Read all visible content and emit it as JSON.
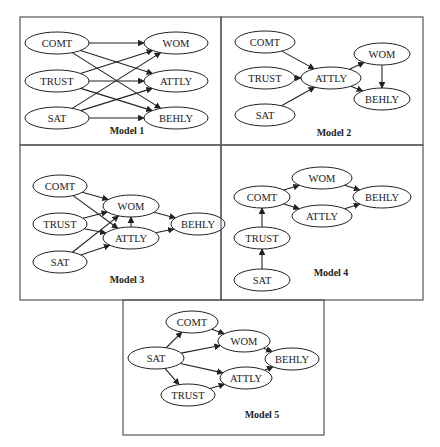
{
  "figure": {
    "panels": [
      {
        "id": "m1",
        "caption": "Model 1",
        "box": [
          20,
          17,
          201,
          128
        ],
        "caption_pos": [
          127,
          134
        ],
        "nodes": [
          {
            "id": "COMT",
            "label": "COMT",
            "cx": 57,
            "cy": 43,
            "rx": 32,
            "ry": 11
          },
          {
            "id": "TRUST",
            "label": "TRUST",
            "cx": 57,
            "cy": 81,
            "rx": 32,
            "ry": 11
          },
          {
            "id": "SAT",
            "label": "SAT",
            "cx": 57,
            "cy": 118,
            "rx": 32,
            "ry": 11
          },
          {
            "id": "WOM",
            "label": "WOM",
            "cx": 176,
            "cy": 43,
            "rx": 32,
            "ry": 11
          },
          {
            "id": "ATTLY",
            "label": "ATTLY",
            "cx": 176,
            "cy": 81,
            "rx": 32,
            "ry": 11
          },
          {
            "id": "BEHLY",
            "label": "BEHLY",
            "cx": 176,
            "cy": 118,
            "rx": 32,
            "ry": 11
          }
        ],
        "edges": [
          [
            "COMT",
            "WOM"
          ],
          [
            "COMT",
            "ATTLY"
          ],
          [
            "COMT",
            "BEHLY"
          ],
          [
            "TRUST",
            "WOM"
          ],
          [
            "TRUST",
            "ATTLY"
          ],
          [
            "TRUST",
            "BEHLY"
          ],
          [
            "SAT",
            "WOM"
          ],
          [
            "SAT",
            "ATTLY"
          ],
          [
            "SAT",
            "BEHLY"
          ]
        ]
      },
      {
        "id": "m2",
        "caption": "Model 2",
        "box": [
          221,
          17,
          202,
          128
        ],
        "caption_pos": [
          334,
          136
        ],
        "nodes": [
          {
            "id": "COMT",
            "label": "COMT",
            "cx": 265,
            "cy": 42,
            "rx": 30,
            "ry": 11
          },
          {
            "id": "TRUST",
            "label": "TRUST",
            "cx": 265,
            "cy": 78,
            "rx": 30,
            "ry": 11
          },
          {
            "id": "SAT",
            "label": "SAT",
            "cx": 265,
            "cy": 115,
            "rx": 30,
            "ry": 11
          },
          {
            "id": "ATTLY",
            "label": "ATTLY",
            "cx": 331,
            "cy": 78,
            "rx": 30,
            "ry": 11
          },
          {
            "id": "WOM",
            "label": "WOM",
            "cx": 382,
            "cy": 54,
            "rx": 28,
            "ry": 11
          },
          {
            "id": "BEHLY",
            "label": "BEHLY",
            "cx": 382,
            "cy": 99,
            "rx": 28,
            "ry": 11
          }
        ],
        "edges": [
          [
            "COMT",
            "ATTLY"
          ],
          [
            "TRUST",
            "ATTLY"
          ],
          [
            "SAT",
            "ATTLY"
          ],
          [
            "ATTLY",
            "WOM"
          ],
          [
            "ATTLY",
            "BEHLY"
          ],
          [
            "WOM",
            "BEHLY"
          ]
        ]
      },
      {
        "id": "m3",
        "caption": "Model 3",
        "box": [
          20,
          145,
          201,
          155
        ],
        "caption_pos": [
          127,
          283
        ],
        "nodes": [
          {
            "id": "COMT",
            "label": "COMT",
            "cx": 60,
            "cy": 186,
            "rx": 27,
            "ry": 11
          },
          {
            "id": "TRUST",
            "label": "TRUST",
            "cx": 60,
            "cy": 224,
            "rx": 27,
            "ry": 11
          },
          {
            "id": "SAT",
            "label": "SAT",
            "cx": 60,
            "cy": 262,
            "rx": 27,
            "ry": 11
          },
          {
            "id": "WOM",
            "label": "WOM",
            "cx": 131,
            "cy": 206,
            "rx": 28,
            "ry": 11
          },
          {
            "id": "ATTLY",
            "label": "ATTLY",
            "cx": 131,
            "cy": 238,
            "rx": 28,
            "ry": 11
          },
          {
            "id": "BEHLY",
            "label": "BEHLY",
            "cx": 198,
            "cy": 224,
            "rx": 27,
            "ry": 11
          }
        ],
        "edges": [
          [
            "COMT",
            "WOM"
          ],
          [
            "COMT",
            "ATTLY"
          ],
          [
            "TRUST",
            "WOM"
          ],
          [
            "TRUST",
            "ATTLY"
          ],
          [
            "SAT",
            "WOM"
          ],
          [
            "SAT",
            "ATTLY"
          ],
          [
            "ATTLY",
            "WOM"
          ],
          [
            "WOM",
            "BEHLY"
          ],
          [
            "ATTLY",
            "BEHLY"
          ]
        ]
      },
      {
        "id": "m4",
        "caption": "Model 4",
        "box": [
          221,
          145,
          202,
          155
        ],
        "caption_pos": [
          331,
          276
        ],
        "nodes": [
          {
            "id": "COMT",
            "label": "COMT",
            "cx": 262,
            "cy": 197,
            "rx": 28,
            "ry": 11
          },
          {
            "id": "TRUST",
            "label": "TRUST",
            "cx": 262,
            "cy": 238,
            "rx": 28,
            "ry": 11
          },
          {
            "id": "SAT",
            "label": "SAT",
            "cx": 262,
            "cy": 280,
            "rx": 28,
            "ry": 11
          },
          {
            "id": "WOM",
            "label": "WOM",
            "cx": 322,
            "cy": 178,
            "rx": 30,
            "ry": 11
          },
          {
            "id": "ATTLY",
            "label": "ATTLY",
            "cx": 322,
            "cy": 216,
            "rx": 30,
            "ry": 11
          },
          {
            "id": "BEHLY",
            "label": "BEHLY",
            "cx": 382,
            "cy": 197,
            "rx": 29,
            "ry": 11
          }
        ],
        "edges": [
          [
            "SAT",
            "TRUST"
          ],
          [
            "TRUST",
            "COMT"
          ],
          [
            "COMT",
            "WOM"
          ],
          [
            "COMT",
            "ATTLY"
          ],
          [
            "WOM",
            "BEHLY"
          ],
          [
            "ATTLY",
            "BEHLY"
          ]
        ]
      },
      {
        "id": "m5",
        "caption": "Model 5",
        "box": [
          123,
          300,
          201,
          135
        ],
        "caption_pos": [
          262,
          418
        ],
        "nodes": [
          {
            "id": "SAT",
            "label": "SAT",
            "cx": 156,
            "cy": 358,
            "rx": 28,
            "ry": 11
          },
          {
            "id": "COMT",
            "label": "COMT",
            "cx": 192,
            "cy": 322,
            "rx": 26,
            "ry": 11
          },
          {
            "id": "TRUST",
            "label": "TRUST",
            "cx": 188,
            "cy": 395,
            "rx": 27,
            "ry": 11
          },
          {
            "id": "WOM",
            "label": "WOM",
            "cx": 244,
            "cy": 341,
            "rx": 26,
            "ry": 11
          },
          {
            "id": "ATTLY",
            "label": "ATTLY",
            "cx": 246,
            "cy": 378,
            "rx": 26,
            "ry": 11
          },
          {
            "id": "BEHLY",
            "label": "BEHLY",
            "cx": 292,
            "cy": 359,
            "rx": 27,
            "ry": 11
          }
        ],
        "edges": [
          [
            "SAT",
            "COMT"
          ],
          [
            "SAT",
            "WOM"
          ],
          [
            "SAT",
            "ATTLY"
          ],
          [
            "SAT",
            "TRUST"
          ],
          [
            "COMT",
            "WOM"
          ],
          [
            "TRUST",
            "ATTLY"
          ],
          [
            "WOM",
            "BEHLY"
          ],
          [
            "ATTLY",
            "BEHLY"
          ]
        ]
      }
    ]
  }
}
